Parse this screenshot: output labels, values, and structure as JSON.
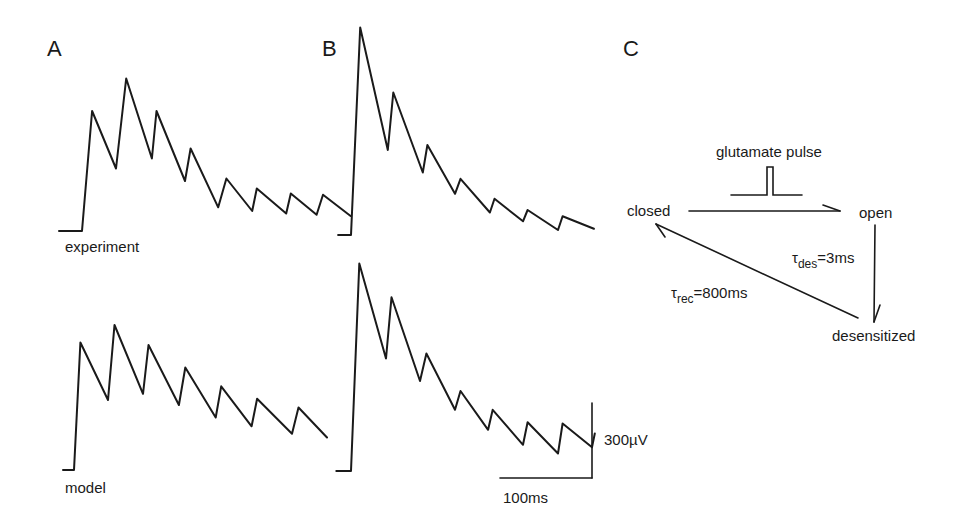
{
  "figure": {
    "panels": [
      {
        "id": "A",
        "label": "A"
      },
      {
        "id": "B",
        "label": "B"
      },
      {
        "id": "C",
        "label": "C"
      }
    ],
    "trace_labels": {
      "experiment": "experiment",
      "model": "model"
    },
    "scale_bar": {
      "voltage_label": "300µV",
      "time_label": "100ms",
      "voltage_value_uV": 300,
      "time_value_ms": 100
    },
    "diagram": {
      "stimulus_label": "glutamate pulse",
      "states": {
        "closed": "closed",
        "open": "open",
        "desensitized": "desensitized"
      },
      "tau_des": {
        "symbol": "τ",
        "subscript": "des",
        "value": "=3ms"
      },
      "tau_rec": {
        "symbol": "τ",
        "subscript": "rec",
        "value": "=800ms"
      },
      "transitions": [
        {
          "from": "closed",
          "to": "open",
          "trigger": "glutamate pulse"
        },
        {
          "from": "open",
          "to": "desensitized",
          "time_constant": "τdes=3ms"
        },
        {
          "from": "desensitized",
          "to": "closed",
          "time_constant": "τrec=800ms"
        }
      ]
    }
  },
  "chart_data": [
    {
      "type": "line",
      "panel": "A",
      "title": "experiment",
      "xlabel": "time (ms)",
      "ylabel": "response (µV)",
      "x": [
        -25,
        -5,
        0,
        11,
        37,
        48,
        76,
        81,
        112,
        118,
        148,
        157,
        185,
        190,
        222,
        227,
        255,
        262,
        292
      ],
      "series": [
        {
          "name": "experiment",
          "values": [
            0,
            0,
            0,
            480,
            250,
            610,
            290,
            480,
            200,
            330,
            95,
            210,
            80,
            170,
            70,
            150,
            65,
            145,
            60
          ]
        }
      ],
      "stimulus_count": 7
    },
    {
      "type": "line",
      "panel": "A",
      "title": "model",
      "xlabel": "time (ms)",
      "ylabel": "response (µV)",
      "x": [
        -12,
        0,
        7,
        37,
        44,
        75,
        81,
        114,
        121,
        154,
        160,
        193,
        199,
        237,
        244,
        275
      ],
      "series": [
        {
          "name": "model",
          "values": [
            0,
            0,
            510,
            280,
            580,
            305,
            500,
            260,
            410,
            210,
            335,
            175,
            285,
            145,
            250,
            130
          ]
        }
      ],
      "stimulus_count": 7
    },
    {
      "type": "line",
      "panel": "B",
      "title": "experiment",
      "xlabel": "time (ms)",
      "ylabel": "response (µV)",
      "x": [
        -14,
        0,
        10,
        40,
        46,
        78,
        83,
        113,
        119,
        151,
        156,
        187,
        192,
        225,
        230,
        264
      ],
      "series": [
        {
          "name": "experiment",
          "values": [
            0,
            0,
            830,
            340,
            570,
            250,
            360,
            165,
            225,
            90,
            145,
            55,
            100,
            20,
            75,
            25
          ]
        }
      ],
      "stimulus_count": 7
    },
    {
      "type": "line",
      "panel": "B",
      "title": "model",
      "xlabel": "time (ms)",
      "ylabel": "response (µV)",
      "x": [
        -16,
        0,
        9,
        38,
        44,
        75,
        82,
        113,
        119,
        149,
        154,
        187,
        192,
        225,
        230,
        262,
        265
      ],
      "series": [
        {
          "name": "model",
          "values": [
            0,
            0,
            830,
            450,
            695,
            360,
            470,
            245,
            320,
            165,
            245,
            105,
            195,
            70,
            190,
            95,
            150
          ]
        }
      ],
      "stimulus_count": 7
    }
  ]
}
